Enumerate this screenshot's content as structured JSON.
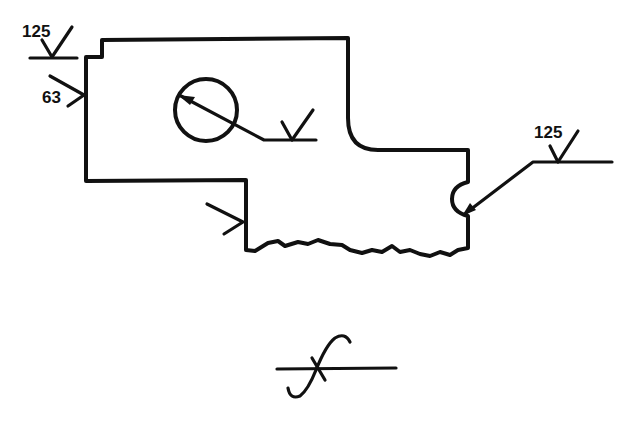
{
  "diagram": {
    "type": "surface-finish-symbols-drawing",
    "colors": {
      "ink": "#111111",
      "background": "#ffffff"
    },
    "symbols": [
      {
        "id": "top-left",
        "value": "125",
        "kind": "roughness-check-with-extension"
      },
      {
        "id": "left-side",
        "value": "63",
        "kind": "roughness-check"
      },
      {
        "id": "bore",
        "value": "",
        "kind": "roughness-check-on-leader"
      },
      {
        "id": "lower-step",
        "value": "",
        "kind": "roughness-check"
      },
      {
        "id": "notch-right",
        "value": "125",
        "kind": "roughness-check-on-leader"
      },
      {
        "id": "bottom",
        "value": "",
        "kind": "unmachined-surface-symbol"
      }
    ],
    "labels": {
      "top_left_value": "125",
      "left_side_value": "63",
      "right_value": "125"
    }
  }
}
